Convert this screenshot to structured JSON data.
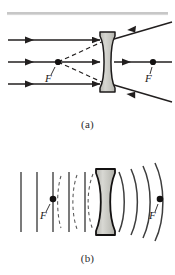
{
  "figure": {
    "colors": {
      "ink": "#221f1f",
      "lens_fill": "#c9c9c4",
      "lens_edge": "#1c1a1a",
      "wavefront": "#4a4a4a",
      "rule": "#8a8a8a"
    },
    "panels": [
      {
        "id": "a",
        "caption": "(a)",
        "description": "Three parallel rays strike a biconcave lens and diverge; dashed back-extensions meet at the near focal point F.",
        "focal_point_left_label": "F",
        "focal_point_right_label": "F",
        "ray_count": 3,
        "dashed_extension_count": 2,
        "lens_type": "biconcave"
      },
      {
        "id": "b",
        "caption": "(b)",
        "description": "Plane wavefronts enter the biconcave lens from the left and emerge as diverging spherical wavefronts centered on the left focal point F.",
        "focal_point_left_label": "F",
        "focal_point_right_label": "F",
        "plane_wavefront_count": 5,
        "curved_wavefront_count": 4,
        "lens_type": "biconcave"
      }
    ]
  }
}
